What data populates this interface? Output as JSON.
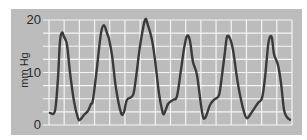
{
  "chart_data": {
    "type": "line",
    "title": "",
    "xlabel": "",
    "ylabel": "mm Hg",
    "ylim": [
      0,
      20
    ],
    "yticks": [
      "0",
      "10",
      "20"
    ],
    "grid": true,
    "legend": null,
    "series": [
      {
        "name": "pressure",
        "x_px": [
          50,
          55,
          58,
          60,
          62,
          64,
          67,
          70,
          74,
          78,
          80,
          84,
          88,
          91,
          93,
          97,
          101,
          104,
          107,
          109,
          112,
          116,
          121,
          124,
          127,
          133,
          136,
          140,
          145,
          148,
          152,
          155,
          159,
          162,
          164,
          168,
          173,
          177,
          181,
          184,
          187,
          190,
          193,
          197,
          202,
          205,
          210,
          214,
          219,
          222,
          225,
          227,
          230,
          233,
          237,
          240,
          244,
          247,
          252,
          258,
          262,
          265,
          268,
          270,
          272,
          274,
          278,
          281,
          284,
          287,
          290
        ],
        "values": [
          2.3,
          2.7,
          9.0,
          16.0,
          17.6,
          16.8,
          15.3,
          10.0,
          4.5,
          1.3,
          1.0,
          1.9,
          2.7,
          4.0,
          4.8,
          11.0,
          17.5,
          19.0,
          17.5,
          16.4,
          13.3,
          7.0,
          2.3,
          2.5,
          4.8,
          5.7,
          9.0,
          15.0,
          20.0,
          19.0,
          16.2,
          12.4,
          6.0,
          2.9,
          2.1,
          4.0,
          4.8,
          5.5,
          10.5,
          14.5,
          17.0,
          16.0,
          12.0,
          9.5,
          2.5,
          1.3,
          3.8,
          4.8,
          5.7,
          9.5,
          14.0,
          16.8,
          16.5,
          14.3,
          9.0,
          5.7,
          2.5,
          1.3,
          2.5,
          4.2,
          5.1,
          9.0,
          15.0,
          16.8,
          16.5,
          13.5,
          11.4,
          8.0,
          2.9,
          1.5,
          1.0
        ]
      }
    ]
  }
}
